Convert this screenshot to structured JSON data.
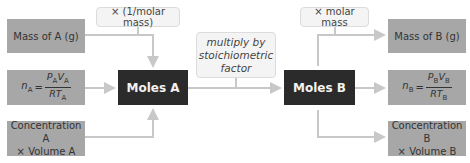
{
  "left_inputs": [
    {
      "label": "Mass of A (g)"
    },
    {
      "label": "n_A = P_A V_A / R T_A",
      "lhs": "n",
      "lhs_sub": "A",
      "num": "P",
      "num_sub1": "A",
      "num2": "V",
      "num_sub2": "A",
      "den": "RT",
      "den_sub": "A"
    },
    {
      "label_line1": "Concentration A",
      "label_line2": "× Volume A"
    }
  ],
  "center_left": {
    "label": "Moles A"
  },
  "center_right": {
    "label": "Moles B"
  },
  "right_outputs": [
    {
      "label": "Mass of B (g)"
    },
    {
      "label": "n_B = P_B V_B / R T_B",
      "lhs": "n",
      "lhs_sub": "B",
      "num": "P",
      "num_sub1": "B",
      "num2": "V",
      "num_sub2": "B",
      "den": "RT",
      "den_sub": "B"
    },
    {
      "label_line1": "Concentration B",
      "label_line2": "× Volume B"
    }
  ],
  "notes": {
    "molar_mass_inverse": "× (1/molar mass)",
    "stoich_line1": "multiply by",
    "stoich_line2": "stoichiometric",
    "stoich_line3": "factor",
    "molar_mass": "× molar mass"
  },
  "colors": {
    "input_box": "#a7a7a7",
    "moles_box": "#2b2b2b",
    "arrow": "#c8c8c8",
    "note_bg": "#f4f4f4"
  }
}
